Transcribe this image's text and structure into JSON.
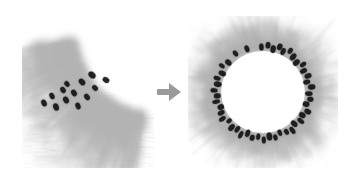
{
  "figure": {
    "type": "micrograph-comparison",
    "background_color": "#ffffff",
    "width": 351,
    "height": 183,
    "modality": "grayscale-brightfield-micrograph",
    "arrow": {
      "icon": "arrow-right-icon",
      "direction": "right",
      "color": "#9a9a9a",
      "x": 154,
      "y": 80,
      "width": 30,
      "height": 24
    },
    "panels": [
      {
        "id": "left",
        "name": "partial-corner-view",
        "x": 22,
        "y": 20,
        "width": 132,
        "height": 148,
        "description": "corner crop showing a curved tissue boundary with radiating fiber texture and dark elliptical spots clustered along the arc",
        "tone_light": "#ffffff",
        "tone_mid": "#dcdcdc",
        "tone_dark": "#b4b4b4",
        "spot_color": "#141414",
        "spot_count": 13,
        "boundary": {
          "shape": "concave-arc",
          "center_x": 128,
          "center_y": 12,
          "radius": 82
        },
        "spots": [
          {
            "x": 22,
            "y": 83,
            "rx": 2.6,
            "ry": 3.6,
            "rot": -22
          },
          {
            "x": 30,
            "y": 76,
            "rx": 2.4,
            "ry": 3.4,
            "rot": -28
          },
          {
            "x": 34,
            "y": 87,
            "rx": 2.8,
            "ry": 3.8,
            "rot": -18
          },
          {
            "x": 41,
            "y": 70,
            "rx": 2.5,
            "ry": 3.3,
            "rot": -34
          },
          {
            "x": 44,
            "y": 80,
            "rx": 2.7,
            "ry": 3.6,
            "rot": -26
          },
          {
            "x": 45,
            "y": 64,
            "rx": 2.3,
            "ry": 3.1,
            "rot": -40
          },
          {
            "x": 52,
            "y": 73,
            "rx": 2.6,
            "ry": 3.5,
            "rot": -32
          },
          {
            "x": 56,
            "y": 86,
            "rx": 2.5,
            "ry": 3.4,
            "rot": -20
          },
          {
            "x": 60,
            "y": 62,
            "rx": 2.7,
            "ry": 3.7,
            "rot": -44
          },
          {
            "x": 65,
            "y": 77,
            "rx": 2.5,
            "ry": 3.4,
            "rot": -36
          },
          {
            "x": 70,
            "y": 55,
            "rx": 3.0,
            "ry": 3.9,
            "rot": -52
          },
          {
            "x": 73,
            "y": 68,
            "rx": 2.4,
            "ry": 3.2,
            "rot": -46
          },
          {
            "x": 84,
            "y": 60,
            "rx": 2.6,
            "ry": 3.5,
            "rot": -58
          }
        ]
      },
      {
        "id": "right",
        "name": "full-ring-view",
        "x": 188,
        "y": 16,
        "width": 150,
        "height": 152,
        "description": "complete annular ring with white lumen, radiating fiber halo and dark elliptical spots distributed around the full circumference",
        "tone_light": "#ffffff",
        "tone_mid": "#dcdcdc",
        "tone_dark": "#b0b0b0",
        "spot_color": "#141414",
        "spot_count": 46,
        "ring": {
          "center_x": 75,
          "center_y": 76,
          "inner_radius": 41,
          "outer_radius": 62
        },
        "spots": [
          {
            "angle": 268,
            "r": 45
          },
          {
            "angle": 276,
            "r": 47
          },
          {
            "angle": 283,
            "r": 44
          },
          {
            "angle": 290,
            "r": 48
          },
          {
            "angle": 296,
            "r": 45
          },
          {
            "angle": 303,
            "r": 49
          },
          {
            "angle": 310,
            "r": 46
          },
          {
            "angle": 318,
            "r": 44
          },
          {
            "angle": 325,
            "r": 48
          },
          {
            "angle": 332,
            "r": 45
          },
          {
            "angle": 340,
            "r": 47
          },
          {
            "angle": 347,
            "r": 44
          },
          {
            "angle": 354,
            "r": 48
          },
          {
            "angle": 2,
            "r": 45
          },
          {
            "angle": 9,
            "r": 47
          },
          {
            "angle": 16,
            "r": 44
          },
          {
            "angle": 24,
            "r": 48
          },
          {
            "angle": 31,
            "r": 45
          },
          {
            "angle": 38,
            "r": 47
          },
          {
            "angle": 46,
            "r": 44
          },
          {
            "angle": 53,
            "r": 48
          },
          {
            "angle": 60,
            "r": 46
          },
          {
            "angle": 68,
            "r": 44
          },
          {
            "angle": 75,
            "r": 47
          },
          {
            "angle": 82,
            "r": 45
          },
          {
            "angle": 89,
            "r": 48
          },
          {
            "angle": 96,
            "r": 45
          },
          {
            "angle": 103,
            "r": 47
          },
          {
            "angle": 110,
            "r": 44
          },
          {
            "angle": 117,
            "r": 48
          },
          {
            "angle": 124,
            "r": 45
          },
          {
            "angle": 131,
            "r": 47
          },
          {
            "angle": 139,
            "r": 44
          },
          {
            "angle": 146,
            "r": 48
          },
          {
            "angle": 153,
            "r": 46
          },
          {
            "angle": 160,
            "r": 44
          },
          {
            "angle": 168,
            "r": 47
          },
          {
            "angle": 175,
            "r": 45
          },
          {
            "angle": 182,
            "r": 48
          },
          {
            "angle": 190,
            "r": 45
          },
          {
            "angle": 197,
            "r": 47
          },
          {
            "angle": 205,
            "r": 44
          },
          {
            "angle": 213,
            "r": 48
          },
          {
            "angle": 221,
            "r": 45
          },
          {
            "angle": 235,
            "r": 47
          },
          {
            "angle": 250,
            "r": 46
          }
        ]
      }
    ]
  }
}
